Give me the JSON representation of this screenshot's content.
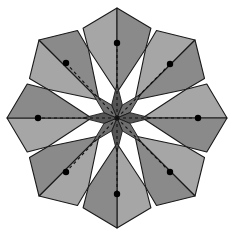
{
  "figure": {
    "type": "geometric-diagram",
    "background_color": "#ffffff",
    "width": 232,
    "height": 239,
    "center": {
      "x": 117,
      "y": 118
    },
    "petal_count": 8,
    "outline_color": "#1a1a1a",
    "outline_width": 1.1,
    "colors": {
      "petal_light": "#a6a6a6",
      "petal_dark": "#8a8a8a",
      "core_light": "#6e6e6e",
      "core_dark": "#555555",
      "fold_line": "#111111",
      "vertex_dot": "#000000"
    },
    "fold_lines": {
      "style": "dashed",
      "dash_pattern": "3,3",
      "count": 8,
      "description": "Dashed radial fold lines running from the centre out to each petal valley vertex"
    },
    "vertex_dots": {
      "count": 8,
      "radius": 3.2,
      "positions": [
        {
          "label": "north",
          "x": 117,
          "y": 43
        },
        {
          "label": "northeast",
          "x": 170,
          "y": 64
        },
        {
          "label": "east",
          "x": 198,
          "y": 118
        },
        {
          "label": "southeast",
          "x": 170,
          "y": 172
        },
        {
          "label": "south",
          "x": 117,
          "y": 194
        },
        {
          "label": "southwest",
          "x": 66,
          "y": 172
        },
        {
          "label": "west",
          "x": 38,
          "y": 118
        },
        {
          "label": "northwest",
          "x": 66,
          "y": 63
        }
      ]
    },
    "petals": [
      {
        "index": 0,
        "label": "petal-north",
        "tip_x": 117,
        "tip_y": 8,
        "angle_deg": -90
      },
      {
        "index": 1,
        "label": "petal-northeast",
        "tip_x": 195,
        "tip_y": 40,
        "angle_deg": -45
      },
      {
        "index": 2,
        "label": "petal-east",
        "tip_x": 227,
        "tip_y": 118,
        "angle_deg": 0
      },
      {
        "index": 3,
        "label": "petal-southeast",
        "tip_x": 195,
        "tip_y": 196,
        "angle_deg": 45
      },
      {
        "index": 4,
        "label": "petal-south",
        "tip_x": 117,
        "tip_y": 228,
        "angle_deg": 90
      },
      {
        "index": 5,
        "label": "petal-southwest",
        "tip_x": 39,
        "tip_y": 196,
        "angle_deg": 135
      },
      {
        "index": 6,
        "label": "petal-west",
        "tip_x": 7,
        "tip_y": 118,
        "angle_deg": 180
      },
      {
        "index": 7,
        "label": "petal-northwest",
        "tip_x": 39,
        "tip_y": 40,
        "angle_deg": -135
      }
    ],
    "core_star": {
      "label": "central-eight-point-star",
      "point_count": 8,
      "outer_radius": 34,
      "inner_radius": 14
    },
    "geometry": {
      "petal_tip_radius": 110,
      "valley_radius": 75,
      "petal_half_width_radius": 96,
      "petal_shoulder_angle_offset_deg": 22.5
    }
  }
}
